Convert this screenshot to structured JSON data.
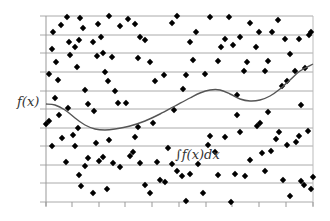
{
  "chart_data": {
    "type": "scatter",
    "title": "",
    "xlabel": "",
    "ylabel": "",
    "annotations": [
      {
        "text": "f(x)",
        "target": "curve",
        "position": "left"
      },
      {
        "text": "∫f(x)dx",
        "target": "region",
        "position": "center-bottom"
      }
    ],
    "grid": {
      "horizontal": true,
      "vertical": false,
      "count": 11
    },
    "x_ticks": 11,
    "plot_area_px": {
      "left": 46,
      "top": 16,
      "right": 313,
      "bottom": 202
    },
    "gridlines_y_px": [
      16,
      35,
      53,
      72,
      91,
      109,
      128,
      146,
      165,
      183,
      202
    ],
    "xticks_x_px": [
      46,
      72,
      99,
      125,
      152,
      179,
      206,
      232,
      259,
      286,
      313
    ],
    "series": [
      {
        "name": "f(x)",
        "kind": "line",
        "color": "#555555",
        "points_px": [
          [
            46,
            104
          ],
          [
            55,
            105
          ],
          [
            65,
            110
          ],
          [
            75,
            118
          ],
          [
            85,
            125
          ],
          [
            95,
            129
          ],
          [
            105,
            130
          ],
          [
            115,
            129
          ],
          [
            130,
            126
          ],
          [
            145,
            121
          ],
          [
            160,
            114
          ],
          [
            175,
            106
          ],
          [
            190,
            98
          ],
          [
            200,
            93
          ],
          [
            210,
            90
          ],
          [
            220,
            90
          ],
          [
            230,
            94
          ],
          [
            240,
            99
          ],
          [
            250,
            101
          ],
          [
            260,
            100
          ],
          [
            270,
            96
          ],
          [
            280,
            89
          ],
          [
            290,
            80
          ],
          [
            300,
            71
          ],
          [
            313,
            64
          ]
        ]
      },
      {
        "name": "samples",
        "kind": "scatter",
        "marker": "diamond",
        "color": "#000000",
        "points_px": [
          [
            49,
            74
          ],
          [
            53,
            32
          ],
          [
            52,
            49
          ],
          [
            56,
            62
          ],
          [
            58,
            80
          ],
          [
            61,
            25
          ],
          [
            67,
            17
          ],
          [
            69,
            42
          ],
          [
            70,
            55
          ],
          [
            75,
            47
          ],
          [
            77,
            67
          ],
          [
            79,
            40
          ],
          [
            80,
            18
          ],
          [
            83,
            28
          ],
          [
            85,
            90
          ],
          [
            88,
            104
          ],
          [
            93,
            42
          ],
          [
            97,
            56
          ],
          [
            98,
            24
          ],
          [
            101,
            37
          ],
          [
            103,
            53
          ],
          [
            105,
            72
          ],
          [
            108,
            81
          ],
          [
            109,
            16
          ],
          [
            112,
            57
          ],
          [
            115,
            91
          ],
          [
            118,
            103
          ],
          [
            120,
            26
          ],
          [
            128,
            19
          ],
          [
            135,
            24
          ],
          [
            140,
            37
          ],
          [
            138,
            58
          ],
          [
            145,
            40
          ],
          [
            150,
            62
          ],
          [
            155,
            81
          ],
          [
            164,
            75
          ],
          [
            172,
            23
          ],
          [
            177,
            16
          ],
          [
            183,
            89
          ],
          [
            186,
            75
          ],
          [
            190,
            42
          ],
          [
            193,
            60
          ],
          [
            196,
            32
          ],
          [
            205,
            74
          ],
          [
            210,
            17
          ],
          [
            218,
            61
          ],
          [
            221,
            47
          ],
          [
            225,
            39
          ],
          [
            229,
            17
          ],
          [
            233,
            45
          ],
          [
            237,
            95
          ],
          [
            240,
            37
          ],
          [
            244,
            71
          ],
          [
            247,
            62
          ],
          [
            250,
            23
          ],
          [
            256,
            47
          ],
          [
            259,
            32
          ],
          [
            265,
            71
          ],
          [
            268,
            61
          ],
          [
            272,
            32
          ],
          [
            278,
            20
          ],
          [
            282,
            86
          ],
          [
            285,
            39
          ],
          [
            287,
            81
          ],
          [
            290,
            54
          ],
          [
            295,
            71
          ],
          [
            299,
            39
          ],
          [
            301,
            105
          ],
          [
            305,
            68
          ],
          [
            309,
            35
          ],
          [
            311,
            32
          ],
          [
            46,
            124
          ],
          [
            49,
            121
          ],
          [
            52,
            146
          ],
          [
            55,
            98
          ],
          [
            59,
            115
          ],
          [
            62,
            138
          ],
          [
            66,
            162
          ],
          [
            68,
            108
          ],
          [
            73,
            135
          ],
          [
            75,
            146
          ],
          [
            78,
            128
          ],
          [
            79,
            175
          ],
          [
            81,
            186
          ],
          [
            85,
            166
          ],
          [
            88,
            158
          ],
          [
            93,
            193
          ],
          [
            94,
            111
          ],
          [
            96,
            143
          ],
          [
            99,
            161
          ],
          [
            103,
            157
          ],
          [
            107,
            189
          ],
          [
            109,
            140
          ],
          [
            113,
            163
          ],
          [
            120,
            167
          ],
          [
            126,
            103
          ],
          [
            130,
            156
          ],
          [
            133,
            152
          ],
          [
            135,
            137
          ],
          [
            138,
            127
          ],
          [
            140,
            163
          ],
          [
            145,
            185
          ],
          [
            150,
            193
          ],
          [
            153,
            123
          ],
          [
            157,
            162
          ],
          [
            160,
            180
          ],
          [
            165,
            182
          ],
          [
            168,
            148
          ],
          [
            172,
            164
          ],
          [
            174,
            110
          ],
          [
            177,
            171
          ],
          [
            182,
            176
          ],
          [
            186,
            201
          ],
          [
            190,
            174
          ],
          [
            198,
            164
          ],
          [
            203,
            193
          ],
          [
            208,
            145
          ],
          [
            210,
            136
          ],
          [
            215,
            152
          ],
          [
            218,
            175
          ],
          [
            225,
            137
          ],
          [
            231,
            202
          ],
          [
            235,
            174
          ],
          [
            237,
            115
          ],
          [
            240,
            132
          ],
          [
            245,
            176
          ],
          [
            250,
            160
          ],
          [
            257,
            126
          ],
          [
            260,
            123
          ],
          [
            262,
            153
          ],
          [
            265,
            171
          ],
          [
            268,
            112
          ],
          [
            271,
            151
          ],
          [
            276,
            139
          ],
          [
            279,
            132
          ],
          [
            283,
            180
          ],
          [
            287,
            145
          ],
          [
            290,
            196
          ],
          [
            296,
            142
          ],
          [
            299,
            136
          ],
          [
            301,
            181
          ],
          [
            304,
            185
          ],
          [
            308,
            131
          ],
          [
            311,
            189
          ],
          [
            313,
            177
          ]
        ]
      }
    ],
    "colors": {
      "grid": "#aaaaaa",
      "axis": "#999999",
      "curve": "#555555",
      "marker": "#000000",
      "text": "#333333"
    }
  }
}
